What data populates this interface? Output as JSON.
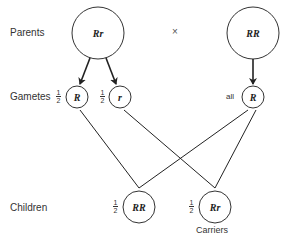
{
  "rows": {
    "parents": "Parents",
    "gametes": "Gametes",
    "children": "Children"
  },
  "cross_symbol": "×",
  "parents": [
    {
      "genotype": "Rr"
    },
    {
      "genotype": "RR"
    }
  ],
  "gametes": [
    {
      "genotype": "R",
      "fraction": {
        "num": "1",
        "den": "2"
      }
    },
    {
      "genotype": "r",
      "fraction": {
        "num": "1",
        "den": "2"
      }
    },
    {
      "genotype": "R",
      "label": "all"
    }
  ],
  "children": [
    {
      "genotype": "RR",
      "fraction": {
        "num": "1",
        "den": "2"
      }
    },
    {
      "genotype": "Rr",
      "fraction": {
        "num": "1",
        "den": "2"
      },
      "caption": "Carriers"
    }
  ]
}
